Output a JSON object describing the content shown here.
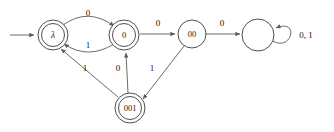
{
  "figure": {
    "name": "finite-automaton-state-diagram",
    "type": "state-transition-diagram",
    "alphabet": [
      "0",
      "1"
    ],
    "background_color": "#ffffff",
    "stroke_color": "#5a5a5a",
    "text_color": "#111111"
  },
  "start": {
    "arrow_label": "",
    "target_state": "lambda"
  },
  "states": [
    {
      "id": "lambda",
      "label": "λ",
      "accepting": true,
      "start": true,
      "cx": 53,
      "cy": 35,
      "r": 15
    },
    {
      "id": "s0",
      "label": "0",
      "accepting": true,
      "start": false,
      "cx": 124,
      "cy": 35,
      "r": 15
    },
    {
      "id": "s00",
      "label": "00",
      "accepting": false,
      "start": false,
      "cx": 192,
      "cy": 34,
      "r": 14
    },
    {
      "id": "s001",
      "label": "001",
      "accepting": true,
      "start": false,
      "cx": 130,
      "cy": 108,
      "r": 15
    },
    {
      "id": "trap",
      "label": "",
      "accepting": false,
      "start": false,
      "cx": 258,
      "cy": 35,
      "r": 16
    }
  ],
  "transitions": [
    {
      "id": "lambda-to-0",
      "from": "lambda",
      "to": "s0",
      "symbol": "0",
      "label_x": 88,
      "label_y": 13
    },
    {
      "id": "0-to-lambda",
      "from": "s0",
      "to": "lambda",
      "symbol": "1",
      "label_x": 88,
      "label_y": 45
    },
    {
      "id": "0-to-00",
      "from": "s0",
      "to": "s00",
      "symbol": "0",
      "label_x": 158,
      "label_y": 23
    },
    {
      "id": "00-to-trap",
      "from": "s00",
      "to": "trap",
      "symbol": "0",
      "label_x": 222,
      "label_y": 23
    },
    {
      "id": "00-to-001",
      "from": "s00",
      "to": "s001",
      "symbol": "1",
      "label_x": 152,
      "label_y": 68
    },
    {
      "id": "001-to-0",
      "from": "s001",
      "to": "s0",
      "symbol": "0",
      "label_x": 118,
      "label_y": 68
    },
    {
      "id": "001-to-lambda",
      "from": "s001",
      "to": "lambda",
      "symbol": "1",
      "label_x": 85,
      "label_y": 68
    },
    {
      "id": "trap-self-loop",
      "from": "trap",
      "to": "trap",
      "symbol": "0, 1",
      "label_x": 306,
      "label_y": 35
    }
  ]
}
